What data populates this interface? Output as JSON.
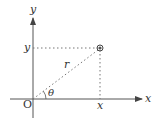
{
  "diagram": {
    "axes": {
      "x_label": "x",
      "y_label": "y",
      "origin_label": "O"
    },
    "point": {
      "x_tick_label": "x",
      "y_tick_label": "y",
      "radius_label": "r",
      "angle_label": "θ"
    },
    "colors": {
      "axis": "#555555",
      "dotted": "#777777",
      "text": "#333333"
    }
  }
}
